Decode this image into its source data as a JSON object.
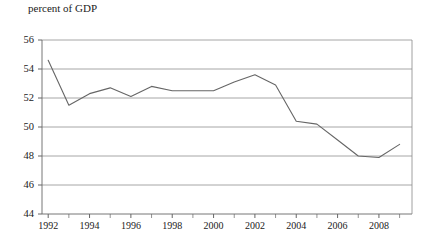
{
  "chart_data": {
    "type": "line",
    "title": "",
    "ylabel": "percent of GDP",
    "xlabel": "",
    "ylim": [
      44,
      56
    ],
    "xlim": [
      1991.7,
      2009.6
    ],
    "ytick_labels": [
      "56",
      "54",
      "52",
      "50",
      "48",
      "46",
      "44"
    ],
    "yticks": [
      56,
      54,
      52,
      50,
      48,
      46,
      44
    ],
    "xtick_labels": [
      "1992",
      "1994",
      "1996",
      "1998",
      "2000",
      "2002",
      "2004",
      "2006",
      "2008"
    ],
    "xticks_major": [
      1992,
      1994,
      1996,
      1998,
      2000,
      2002,
      2004,
      2006,
      2008
    ],
    "xticks_minor": [
      1993,
      1995,
      1997,
      1999,
      2001,
      2003,
      2005,
      2007,
      2009
    ],
    "grid": true,
    "grid_axis": "y",
    "legend": "none",
    "series": [
      {
        "name": "percent of GDP",
        "color": "#666666",
        "x": [
          1992,
          1993,
          1994,
          1995,
          1996,
          1997,
          1998,
          1999,
          2000,
          2001,
          2002,
          2003,
          2004,
          2005,
          2006,
          2007,
          2008,
          2009
        ],
        "values": [
          54.6,
          51.5,
          52.3,
          52.7,
          52.1,
          52.8,
          52.5,
          52.5,
          52.5,
          53.1,
          53.6,
          52.9,
          50.4,
          50.2,
          49.1,
          48.0,
          47.9,
          48.8
        ]
      }
    ]
  },
  "figure": {
    "ylabel_text": "percent of GDP"
  }
}
